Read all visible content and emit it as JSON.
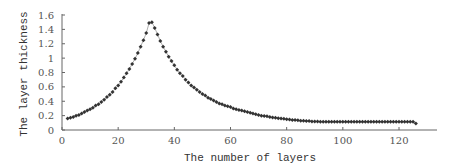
{
  "chart_data": {
    "type": "scatter",
    "title": "",
    "xlabel": "The number of layers",
    "ylabel": "The layer thickness",
    "xlim": [
      0,
      134
    ],
    "ylim": [
      0,
      1.6
    ],
    "xticks": [
      "0",
      "20",
      "40",
      "60",
      "80",
      "100",
      "120"
    ],
    "yticks": [
      "0",
      "0.2",
      "0.4",
      "0.6",
      "0.8",
      "1",
      "1.2",
      "1.4",
      "1.6"
    ],
    "grid": false,
    "legend": null,
    "marker_color": "#333333",
    "series": [
      {
        "name": "layer thickness",
        "x": [
          2,
          3,
          4,
          5,
          6,
          7,
          8,
          9,
          10,
          11,
          12,
          13,
          14,
          15,
          16,
          17,
          18,
          19,
          20,
          21,
          22,
          23,
          24,
          25,
          26,
          27,
          28,
          29,
          30,
          31,
          32,
          33,
          34,
          35,
          36,
          37,
          38,
          39,
          40,
          41,
          42,
          43,
          44,
          45,
          46,
          47,
          48,
          49,
          50,
          51,
          52,
          53,
          54,
          55,
          56,
          57,
          58,
          59,
          60,
          61,
          62,
          63,
          64,
          65,
          66,
          67,
          68,
          69,
          70,
          71,
          72,
          73,
          74,
          75,
          76,
          77,
          78,
          79,
          80,
          81,
          82,
          83,
          84,
          85,
          86,
          87,
          88,
          89,
          90,
          91,
          92,
          93,
          94,
          95,
          96,
          97,
          98,
          99,
          100,
          101,
          102,
          103,
          104,
          105,
          106,
          107,
          108,
          109,
          110,
          111,
          112,
          113,
          114,
          115,
          116,
          117,
          118,
          119,
          120,
          121,
          122,
          123,
          124,
          125,
          126
        ],
        "y": [
          0.16,
          0.17,
          0.18,
          0.2,
          0.21,
          0.23,
          0.25,
          0.27,
          0.29,
          0.31,
          0.34,
          0.36,
          0.39,
          0.42,
          0.46,
          0.49,
          0.53,
          0.58,
          0.62,
          0.67,
          0.73,
          0.79,
          0.85,
          0.92,
          0.99,
          1.07,
          1.16,
          1.25,
          1.35,
          1.49,
          1.5,
          1.42,
          1.33,
          1.24,
          1.16,
          1.09,
          1.02,
          0.96,
          0.9,
          0.84,
          0.79,
          0.75,
          0.7,
          0.66,
          0.62,
          0.59,
          0.56,
          0.53,
          0.5,
          0.48,
          0.45,
          0.43,
          0.41,
          0.39,
          0.37,
          0.36,
          0.34,
          0.33,
          0.32,
          0.3,
          0.29,
          0.28,
          0.27,
          0.26,
          0.25,
          0.24,
          0.23,
          0.22,
          0.21,
          0.2,
          0.195,
          0.19,
          0.18,
          0.175,
          0.17,
          0.165,
          0.16,
          0.155,
          0.15,
          0.145,
          0.14,
          0.14,
          0.135,
          0.13,
          0.13,
          0.125,
          0.125,
          0.12,
          0.12,
          0.12,
          0.115,
          0.115,
          0.115,
          0.115,
          0.115,
          0.115,
          0.115,
          0.115,
          0.115,
          0.115,
          0.115,
          0.115,
          0.115,
          0.115,
          0.115,
          0.115,
          0.115,
          0.115,
          0.115,
          0.115,
          0.115,
          0.115,
          0.115,
          0.115,
          0.115,
          0.115,
          0.115,
          0.115,
          0.115,
          0.115,
          0.115,
          0.115,
          0.115,
          0.115,
          0.09
        ]
      }
    ]
  },
  "axes": {
    "x_label": "The number of layers",
    "y_label": "The layer thickness"
  }
}
